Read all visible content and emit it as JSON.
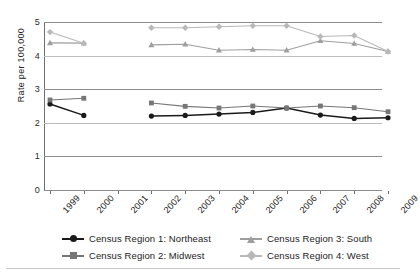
{
  "chart_data": {
    "type": "line",
    "title": "",
    "xlabel": "",
    "ylabel": "Rate per 100,000",
    "x": [
      1999,
      2000,
      2001,
      2002,
      2003,
      2004,
      2005,
      2006,
      2007,
      2008,
      2009
    ],
    "xticklabels": [
      "1999",
      "2000",
      "2001",
      "2002",
      "2003",
      "2004",
      "2005",
      "2006",
      "2007",
      "2008",
      "2009"
    ],
    "ylim": [
      0,
      5
    ],
    "yticks": [
      0,
      1,
      2,
      3,
      4,
      5
    ],
    "yticklabels": [
      "0",
      "1",
      "2",
      "3",
      "4",
      "5"
    ],
    "grid": "horizontal",
    "legend_position": "below-axes",
    "series": [
      {
        "name": "Census Region 1: Northeast",
        "color": "#1a1a1a",
        "marker": "circle",
        "values": [
          2.56,
          2.22,
          null,
          2.2,
          2.22,
          2.26,
          2.31,
          2.44,
          2.23,
          2.13,
          2.15
        ]
      },
      {
        "name": "Census Region 2: Midwest",
        "color": "#767676",
        "marker": "square",
        "values": [
          2.68,
          2.73,
          null,
          2.59,
          2.49,
          2.44,
          2.5,
          2.44,
          2.5,
          2.45,
          2.33
        ]
      },
      {
        "name": "Census Region 3: South",
        "color": "#9e9e9e",
        "marker": "triangle",
        "values": [
          4.38,
          4.37,
          null,
          4.32,
          4.34,
          4.16,
          4.18,
          4.16,
          4.44,
          4.36,
          4.12
        ]
      },
      {
        "name": "Census Region 4: West",
        "color": "#b8b8b8",
        "marker": "diamond",
        "values": [
          4.7,
          4.37,
          null,
          4.83,
          4.83,
          4.86,
          4.89,
          4.89,
          4.57,
          4.6,
          4.12
        ]
      }
    ]
  },
  "legend": {
    "items": [
      {
        "label": "Census Region 1: Northeast"
      },
      {
        "label": "Census Region 3: South"
      },
      {
        "label": "Census Region 2: Midwest"
      },
      {
        "label": "Census Region 4: West"
      }
    ]
  }
}
